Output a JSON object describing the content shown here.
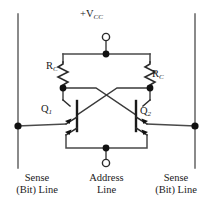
{
  "diagram": {
    "supply": {
      "prefix": "+",
      "symbol": "V",
      "subscript": "CC",
      "full": "+VCC"
    },
    "resistors": [
      {
        "id": "rc-left",
        "symbol": "R",
        "subscript": "C",
        "full": "RC"
      },
      {
        "id": "rc-right",
        "symbol": "R",
        "subscript": "C",
        "full": "RC"
      }
    ],
    "transistors": [
      {
        "id": "q1",
        "symbol": "Q",
        "subscript": "1",
        "full": "Q1"
      },
      {
        "id": "q2",
        "symbol": "Q",
        "subscript": "2",
        "full": "Q2"
      }
    ],
    "captions": [
      {
        "id": "sense-left",
        "line1": "Sense",
        "line2": "(Bit) Line"
      },
      {
        "id": "address",
        "line1": "Address",
        "line2": "Line"
      },
      {
        "id": "sense-right",
        "line1": "Sense",
        "line2": "(Bit) Line"
      }
    ],
    "colors": {
      "wire": "#2b2b2b",
      "wire_light": "#6b6b6b",
      "node": "#111111",
      "terminal_fill": "#ffffff",
      "text": "#1a1a1a",
      "background": "#ffffff"
    },
    "terminals": [
      {
        "id": "vcc-terminal",
        "type": "open-circle",
        "x": 106,
        "y": 36
      },
      {
        "id": "address-terminal",
        "type": "open-circle",
        "x": 106,
        "y": 163
      }
    ],
    "nodes": [
      {
        "id": "vcc-node",
        "x": 106,
        "y": 54
      },
      {
        "id": "collector-left",
        "x": 63,
        "y": 88
      },
      {
        "id": "collector-right",
        "x": 150,
        "y": 88
      },
      {
        "id": "sense-left-node",
        "x": 18,
        "y": 126
      },
      {
        "id": "sense-right-node",
        "x": 195,
        "y": 126
      },
      {
        "id": "address-node",
        "x": 106,
        "y": 148
      }
    ]
  }
}
